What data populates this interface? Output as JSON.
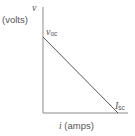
{
  "diagram": {
    "y_axis": {
      "symbol": "v",
      "unit": "(volts)"
    },
    "x_axis": {
      "symbol": "i",
      "unit": "(amps)"
    },
    "y_intercept": {
      "symbol": "v",
      "subscript": "oc"
    },
    "x_intercept": {
      "symbol": "I",
      "subscript": "sc"
    },
    "colors": {
      "axis": "#8a8a8a",
      "line": "#555555",
      "text": "#555555"
    }
  }
}
